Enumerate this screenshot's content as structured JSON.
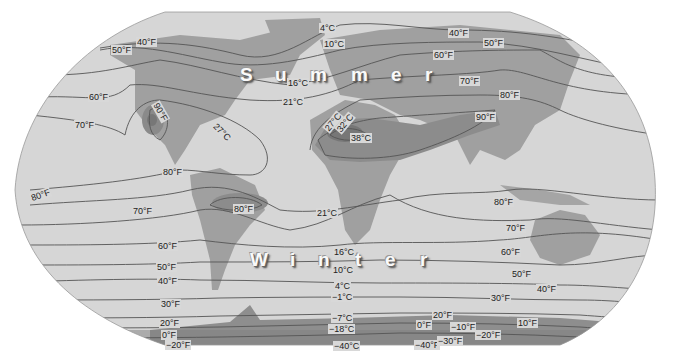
{
  "map": {
    "title": "World isotherm map (summer and winter)",
    "colors": {
      "ocean": "#d6d6d6",
      "land": "#9e9e9e",
      "hot_land": "#8a8a8a",
      "hottest": "#6f6f6f",
      "antarctica": "#8c8c8c",
      "line": "#555555"
    },
    "season_labels": {
      "summer": [
        "S",
        "u",
        "m",
        "m",
        "e",
        "r"
      ],
      "winter": [
        "W",
        "i",
        "n",
        "t",
        "e",
        "r"
      ]
    },
    "labels": {
      "f40n_w": "40°F",
      "f50n_w": "50°F",
      "c4n": "4°C",
      "c10n": "10°C",
      "f40n_e": "40°F",
      "f50n_e": "50°F",
      "f60n_e": "60°F",
      "c16n": "16°C",
      "f70n_e": "70°F",
      "f60n_w": "60°F",
      "c21n": "21°C",
      "f80n_e": "80°F",
      "f70n_w": "70°F",
      "f90n_na": "90°F",
      "c27n": "27°C",
      "c27af": "27°C",
      "c32af": "32°C",
      "c38af": "38°C",
      "f90n_as": "90°F",
      "f80eq_w": "80°F",
      "f80sa": "80°F",
      "f80eq_far": "80°F",
      "f70s_w": "70°F",
      "c21s": "21°C",
      "f80s_e": "80°F",
      "f70s_e": "70°F",
      "f60s_w": "60°F",
      "c16s": "16°C",
      "f60s_e": "60°F",
      "f50s_w": "50°F",
      "c10s": "10°C",
      "f50s_e": "50°F",
      "f40s_w": "40°F",
      "c4s": "4°C",
      "f40s_e": "40°F",
      "f30s_w": "30°F",
      "cm1s": "−1°C",
      "f30s_e": "30°F",
      "f20s_w": "20°F",
      "cm7s": "−7°C",
      "f20s_e": "20°F",
      "f10s_e": "10°F",
      "f0s_w": "0°F",
      "cm18s": "−18°C",
      "f0s_e": "0°F",
      "fm10s": "−10°F",
      "fm20s_e": "−20°F",
      "fm20s_w": "−20°F",
      "cm40s": "−40°C",
      "fm40s": "−40°F",
      "fm30s": "−30°F"
    }
  }
}
